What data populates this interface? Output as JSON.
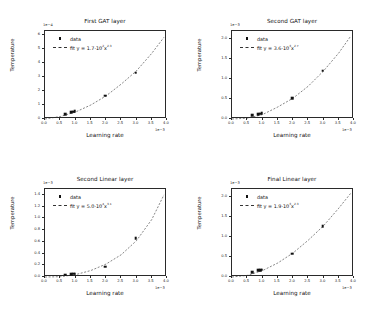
{
  "figure": {
    "background": "#ffffff",
    "marker_color": "#111111",
    "line_color": "#333333"
  },
  "common": {
    "xlabel": "Learning rate",
    "ylabel": "Temperature",
    "legend_data_label": "data",
    "x_exponent": "1e−3",
    "xticks": [
      "0.0",
      "0.5",
      "1.0",
      "1.5",
      "2.0",
      "2.5",
      "3.0",
      "3.5",
      "4.0"
    ],
    "xtick_values": [
      0.0,
      0.5,
      1.0,
      1.5,
      2.0,
      2.5,
      3.0,
      3.5,
      4.0
    ]
  },
  "chart_data": [
    {
      "type": "scatter",
      "panel": "top-left",
      "title": "First GAT layer",
      "xlabel": "Learning rate",
      "ylabel": "Temperature",
      "x_exponent": "1e−3",
      "y_exponent": "1e−4",
      "xlim": [
        0.0,
        4.0
      ],
      "ylim": [
        0.0,
        6.3
      ],
      "xticks": [
        "0.0",
        "0.5",
        "1.0",
        "1.5",
        "2.0",
        "2.5",
        "3.0",
        "3.5",
        "4.0"
      ],
      "yticks": [
        "0",
        "1",
        "2",
        "3",
        "4",
        "5",
        "6"
      ],
      "ytick_values": [
        0,
        1,
        2,
        3,
        4,
        5,
        6
      ],
      "grid": false,
      "legend_position": "upper left",
      "legend": [
        "data",
        "fit y = 1.7·10²x^2.3"
      ],
      "fit_label": "fit y = 1.7·10",
      "fit_coefficient": 1.7,
      "fit_coef_exponent": "2",
      "fit_power": "2.3",
      "series": [
        {
          "name": "data",
          "x": [
            0.7,
            0.9,
            0.95,
            1.0,
            2.0,
            3.0
          ],
          "y": [
            0.28,
            0.42,
            0.45,
            0.5,
            1.6,
            3.25
          ]
        },
        {
          "name": "fit",
          "x": [
            0.0,
            0.5,
            1.0,
            1.5,
            2.0,
            2.5,
            3.0,
            3.5,
            3.9
          ],
          "y": [
            0.0,
            0.18,
            0.5,
            1.0,
            1.65,
            2.5,
            3.45,
            4.7,
            5.85
          ]
        }
      ]
    },
    {
      "type": "scatter",
      "panel": "top-right",
      "title": "Second GAT layer",
      "xlabel": "Learning rate",
      "ylabel": "Temperature",
      "x_exponent": "1e−3",
      "y_exponent": "1e−3",
      "xlim": [
        0.0,
        4.0
      ],
      "ylim": [
        0.0,
        2.2
      ],
      "xticks": [
        "0.0",
        "0.5",
        "1.0",
        "1.5",
        "2.0",
        "2.5",
        "3.0",
        "3.5",
        "4.0"
      ],
      "yticks": [
        "0.0",
        "0.5",
        "1.0",
        "1.5",
        "2.0"
      ],
      "ytick_values": [
        0.0,
        0.5,
        1.0,
        1.5,
        2.0
      ],
      "grid": false,
      "legend_position": "upper left",
      "legend": [
        "data",
        "fit y = 3.6·10³x^2.7"
      ],
      "fit_label": "fit y = 3.6·10",
      "fit_coefficient": 3.6,
      "fit_coef_exponent": "3",
      "fit_power": "2.7",
      "series": [
        {
          "name": "data",
          "x": [
            0.7,
            0.9,
            0.95,
            1.0,
            2.0,
            3.0
          ],
          "y": [
            0.07,
            0.1,
            0.11,
            0.12,
            0.5,
            1.18
          ]
        },
        {
          "name": "fit",
          "x": [
            0.0,
            0.5,
            1.0,
            1.5,
            2.0,
            2.5,
            3.0,
            3.5,
            3.9
          ],
          "y": [
            0.0,
            0.02,
            0.11,
            0.3,
            0.52,
            0.82,
            1.2,
            1.65,
            2.08
          ]
        }
      ]
    },
    {
      "type": "scatter",
      "panel": "bottom-left",
      "title": "Second Linear layer",
      "xlabel": "Learning rate",
      "ylabel": "Temperature",
      "x_exponent": "1e−3",
      "y_exponent": "1e−3",
      "xlim": [
        0.0,
        4.0
      ],
      "ylim": [
        0.0,
        1.5
      ],
      "xticks": [
        "0.0",
        "0.5",
        "1.0",
        "1.5",
        "2.0",
        "2.5",
        "3.0",
        "3.5",
        "4.0"
      ],
      "yticks": [
        "0.0",
        "0.2",
        "0.4",
        "0.6",
        "0.8",
        "1.0",
        "1.2",
        "1.4"
      ],
      "ytick_values": [
        0.0,
        0.2,
        0.4,
        0.6,
        0.8,
        1.0,
        1.2,
        1.4
      ],
      "grid": false,
      "legend_position": "upper left",
      "legend": [
        "data",
        "fit y = 5.0·10⁴x^3.1"
      ],
      "fit_label": "fit y = 5.0·10",
      "fit_coefficient": 5.0,
      "fit_coef_exponent": "4",
      "fit_power": "3.1",
      "series": [
        {
          "name": "data",
          "x": [
            0.7,
            0.9,
            0.95,
            1.0,
            2.0,
            3.0
          ],
          "y": [
            0.025,
            0.035,
            0.038,
            0.04,
            0.16,
            0.64
          ]
        },
        {
          "name": "fit",
          "x": [
            0.0,
            0.5,
            1.0,
            1.5,
            2.0,
            2.5,
            3.0,
            3.5,
            3.9
          ],
          "y": [
            0.0,
            0.005,
            0.04,
            0.11,
            0.22,
            0.38,
            0.62,
            0.98,
            1.4
          ]
        }
      ]
    },
    {
      "type": "scatter",
      "panel": "bottom-right",
      "title": "Final Linear layer",
      "xlabel": "Learning rate",
      "ylabel": "Temperature",
      "x_exponent": "1e−3",
      "y_exponent": "1e−3",
      "xlim": [
        0.0,
        4.0
      ],
      "ylim": [
        0.0,
        2.2
      ],
      "xticks": [
        "0.0",
        "0.5",
        "1.0",
        "1.5",
        "2.0",
        "2.5",
        "3.0",
        "3.5",
        "4.0"
      ],
      "yticks": [
        "0.0",
        "0.5",
        "1.0",
        "1.5",
        "2.0"
      ],
      "ytick_values": [
        0.0,
        0.5,
        1.0,
        1.5,
        2.0
      ],
      "grid": false,
      "legend_position": "upper left",
      "legend": [
        "data",
        "fit y = 1.9·10³x^2.3"
      ],
      "fit_label": "fit y = 1.9·10",
      "fit_coefficient": 1.9,
      "fit_coef_exponent": "3",
      "fit_power": "2.3",
      "series": [
        {
          "name": "data",
          "x": [
            0.7,
            0.9,
            0.95,
            1.0,
            2.0,
            3.0
          ],
          "y": [
            0.1,
            0.14,
            0.15,
            0.16,
            0.56,
            1.25
          ]
        },
        {
          "name": "fit",
          "x": [
            0.0,
            0.5,
            1.0,
            1.5,
            2.0,
            2.5,
            3.0,
            3.5,
            3.9
          ],
          "y": [
            0.0,
            0.04,
            0.16,
            0.35,
            0.6,
            0.92,
            1.28,
            1.72,
            2.1
          ]
        }
      ]
    }
  ]
}
